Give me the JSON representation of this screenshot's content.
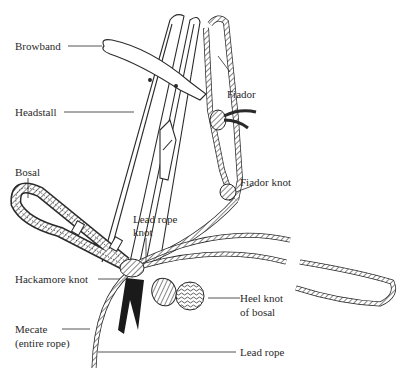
{
  "diagram": {
    "ink_color": "#2a2a2a",
    "background": "#ffffff",
    "labels": {
      "browband": "Browband",
      "headstall": "Headstall",
      "fiador": "Fiador",
      "fiador_knot": "Fiador knot",
      "bosal": "Bosal",
      "lead_rope_knot_line1": "Lead rope",
      "lead_rope_knot_line2": "knot",
      "hackamore_knot": "Hackamore knot",
      "heel_knot_line1": "Heel knot",
      "heel_knot_line2": "of bosal",
      "mecate_line1": "Mecate",
      "mecate_line2": "(entire rope)",
      "lead_rope": "Lead rope"
    }
  }
}
